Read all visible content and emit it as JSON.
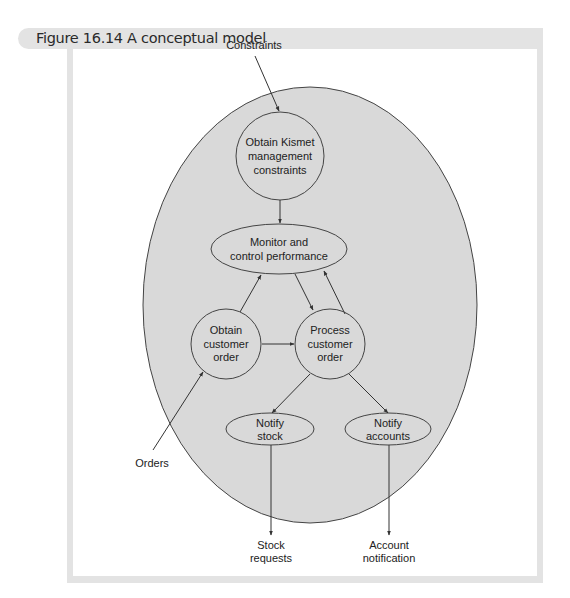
{
  "figure": {
    "title": "Figure 16.14 A conceptual model"
  },
  "colors": {
    "header_band": "#e3e3e3",
    "system_fill": "#d9d9d9",
    "node_fill": "#d9d9d9",
    "stroke": "#333333",
    "text": "#222222"
  },
  "diagram": {
    "system_boundary": {
      "shape": "ellipse"
    },
    "nodes": [
      {
        "id": "obtain-kismet",
        "shape": "circle",
        "lines": [
          "Obtain Kismet",
          "management",
          "constraints"
        ]
      },
      {
        "id": "monitor",
        "shape": "ellipse",
        "lines": [
          "Monitor and",
          "control performance"
        ]
      },
      {
        "id": "obtain-order",
        "shape": "circle",
        "lines": [
          "Obtain",
          "customer",
          "order"
        ]
      },
      {
        "id": "process-order",
        "shape": "circle",
        "lines": [
          "Process",
          "customer",
          "order"
        ]
      },
      {
        "id": "notify-stock",
        "shape": "ellipse",
        "lines": [
          "Notify",
          "stock"
        ]
      },
      {
        "id": "notify-accounts",
        "shape": "ellipse",
        "lines": [
          "Notify",
          "accounts"
        ]
      }
    ],
    "external_labels": {
      "constraints": "Constraints",
      "orders": "Orders",
      "stock_requests": [
        "Stock",
        "requests"
      ],
      "account_notification": [
        "Account",
        "notification"
      ]
    },
    "edges": [
      {
        "from": "Constraints",
        "to": "obtain-kismet"
      },
      {
        "from": "obtain-kismet",
        "to": "monitor"
      },
      {
        "from": "obtain-order",
        "to": "monitor"
      },
      {
        "from": "monitor",
        "to": "process-order"
      },
      {
        "from": "process-order",
        "to": "monitor"
      },
      {
        "from": "obtain-order",
        "to": "process-order"
      },
      {
        "from": "Orders",
        "to": "obtain-order"
      },
      {
        "from": "process-order",
        "to": "notify-stock"
      },
      {
        "from": "process-order",
        "to": "notify-accounts"
      },
      {
        "from": "notify-stock",
        "to": "Stock requests"
      },
      {
        "from": "notify-accounts",
        "to": "Account notification"
      }
    ]
  }
}
